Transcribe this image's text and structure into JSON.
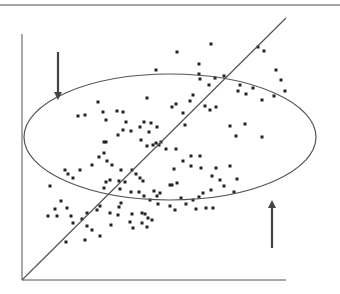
{
  "diagram": {
    "type": "scatter-with-regression-and-ellipse",
    "colors": {
      "stroke": "#555555",
      "dot": "#222222",
      "arrow": "#444444",
      "topRule": "#888888"
    },
    "top_rule": {
      "x1": 0,
      "y1": 5,
      "x2": 340,
      "y2": 5
    },
    "axes": {
      "origin": [
        22,
        280
      ],
      "x_end": 286,
      "y_top": 34
    },
    "regression_line": {
      "x1": 22,
      "y1": 280,
      "x2": 286,
      "y2": 18
    },
    "ellipse": {
      "cx": 170,
      "cy": 137,
      "rx": 146,
      "ry": 63
    },
    "arrows": [
      {
        "name": "down-arrow",
        "x": 58,
        "y1": 52,
        "y2": 100
      },
      {
        "name": "up-arrow",
        "x": 272,
        "y1": 248,
        "y2": 200
      }
    ],
    "points": [
      [
        156,
        70
      ],
      [
        211,
        44
      ],
      [
        177,
        52
      ],
      [
        258,
        47
      ],
      [
        264,
        51
      ],
      [
        199,
        64
      ],
      [
        199,
        74
      ],
      [
        276,
        70
      ],
      [
        281,
        80
      ],
      [
        224,
        76
      ],
      [
        274,
        96
      ],
      [
        215,
        78
      ],
      [
        200,
        79
      ],
      [
        240,
        85
      ],
      [
        209,
        85
      ],
      [
        253,
        88
      ],
      [
        238,
        91
      ],
      [
        285,
        91
      ],
      [
        147,
        98
      ],
      [
        117,
        111
      ],
      [
        123,
        112
      ],
      [
        126,
        122
      ],
      [
        144,
        122
      ],
      [
        151,
        123
      ],
      [
        157,
        127
      ],
      [
        140,
        127
      ],
      [
        149,
        132
      ],
      [
        183,
        113
      ],
      [
        205,
        106
      ],
      [
        210,
        110
      ],
      [
        216,
        107
      ],
      [
        193,
        95
      ],
      [
        190,
        101
      ],
      [
        246,
        94
      ],
      [
        262,
        100
      ],
      [
        230,
        126
      ],
      [
        245,
        124
      ],
      [
        262,
        137
      ],
      [
        236,
        136
      ],
      [
        176,
        104
      ],
      [
        185,
        125
      ],
      [
        172,
        107
      ],
      [
        98,
        102
      ],
      [
        103,
        112
      ],
      [
        78,
        116
      ],
      [
        85,
        115
      ],
      [
        106,
        120
      ],
      [
        118,
        135
      ],
      [
        104,
        142
      ],
      [
        106,
        142
      ],
      [
        123,
        130
      ],
      [
        131,
        131
      ],
      [
        141,
        140
      ],
      [
        156,
        143
      ],
      [
        153,
        145
      ],
      [
        147,
        146
      ],
      [
        159,
        145
      ],
      [
        161,
        142
      ],
      [
        176,
        149
      ],
      [
        166,
        149
      ],
      [
        200,
        156
      ],
      [
        191,
        156
      ],
      [
        183,
        161
      ],
      [
        174,
        169
      ],
      [
        191,
        166
      ],
      [
        201,
        168
      ],
      [
        216,
        168
      ],
      [
        212,
        176
      ],
      [
        220,
        180
      ],
      [
        230,
        166
      ],
      [
        224,
        186
      ],
      [
        237,
        179
      ],
      [
        234,
        192
      ],
      [
        65,
        170
      ],
      [
        68,
        174
      ],
      [
        73,
        178
      ],
      [
        80,
        170
      ],
      [
        92,
        165
      ],
      [
        107,
        161
      ],
      [
        104,
        153
      ],
      [
        99,
        157
      ],
      [
        112,
        165
      ],
      [
        121,
        170
      ],
      [
        132,
        170
      ],
      [
        119,
        181
      ],
      [
        110,
        180
      ],
      [
        106,
        182
      ],
      [
        104,
        188
      ],
      [
        120,
        189
      ],
      [
        136,
        174
      ],
      [
        140,
        178
      ],
      [
        143,
        181
      ],
      [
        125,
        182
      ],
      [
        131,
        192
      ],
      [
        139,
        192
      ],
      [
        144,
        196
      ],
      [
        154,
        191
      ],
      [
        160,
        193
      ],
      [
        172,
        185
      ],
      [
        177,
        183
      ],
      [
        170,
        185
      ],
      [
        157,
        196
      ],
      [
        181,
        198
      ],
      [
        199,
        197
      ],
      [
        211,
        190
      ],
      [
        203,
        193
      ],
      [
        193,
        200
      ],
      [
        186,
        204
      ],
      [
        196,
        209
      ],
      [
        206,
        208
      ],
      [
        213,
        208
      ],
      [
        170,
        206
      ],
      [
        175,
        210
      ],
      [
        150,
        200
      ],
      [
        158,
        204
      ],
      [
        50,
        186
      ],
      [
        55,
        209
      ],
      [
        61,
        201
      ],
      [
        67,
        208
      ],
      [
        48,
        216
      ],
      [
        57,
        216
      ],
      [
        71,
        216
      ],
      [
        82,
        219
      ],
      [
        87,
        213
      ],
      [
        97,
        210
      ],
      [
        100,
        206
      ],
      [
        110,
        213
      ],
      [
        119,
        207
      ],
      [
        121,
        203
      ],
      [
        118,
        215
      ],
      [
        132,
        214
      ],
      [
        130,
        222
      ],
      [
        142,
        213
      ],
      [
        145,
        214
      ],
      [
        148,
        218
      ],
      [
        142,
        223
      ],
      [
        147,
        227
      ],
      [
        152,
        220
      ],
      [
        133,
        228
      ],
      [
        111,
        225
      ],
      [
        87,
        226
      ],
      [
        73,
        223
      ],
      [
        92,
        230
      ],
      [
        100,
        236
      ],
      [
        85,
        240
      ],
      [
        66,
        242
      ]
    ]
  }
}
